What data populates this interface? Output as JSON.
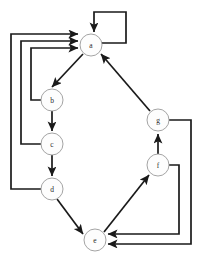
{
  "diagram": {
    "type": "directed-graph",
    "canvas": {
      "width": 199,
      "height": 264,
      "background": "#ffffff"
    },
    "style": {
      "edge_color": "#1a1a1a",
      "node_fill": "#fdfdfd",
      "node_stroke": "#9a9a9a",
      "label_color": "#2b2b2b",
      "node_radius": 11,
      "edge_width": 1.7
    },
    "nodes": [
      {
        "id": "a",
        "label": "a",
        "x": 91,
        "y": 45
      },
      {
        "id": "b",
        "label": "b",
        "x": 52,
        "y": 100
      },
      {
        "id": "c",
        "label": "c",
        "x": 52,
        "y": 144
      },
      {
        "id": "d",
        "label": "d",
        "x": 52,
        "y": 189
      },
      {
        "id": "e",
        "label": "e",
        "x": 95,
        "y": 240
      },
      {
        "id": "f",
        "label": "f",
        "x": 158,
        "y": 165
      },
      {
        "id": "g",
        "label": "g",
        "x": 158,
        "y": 120
      }
    ],
    "edges": [
      {
        "id": "a-a",
        "from": "a",
        "to": "a",
        "kind": "self-loop"
      },
      {
        "id": "a-b",
        "from": "a",
        "to": "b",
        "kind": "straight"
      },
      {
        "id": "b-c",
        "from": "b",
        "to": "c",
        "kind": "straight"
      },
      {
        "id": "c-d",
        "from": "c",
        "to": "d",
        "kind": "straight"
      },
      {
        "id": "d-e",
        "from": "d",
        "to": "e",
        "kind": "straight"
      },
      {
        "id": "e-f",
        "from": "e",
        "to": "f",
        "kind": "straight"
      },
      {
        "id": "f-g",
        "from": "f",
        "to": "g",
        "kind": "straight"
      },
      {
        "id": "g-a",
        "from": "g",
        "to": "a",
        "kind": "straight"
      },
      {
        "id": "b-a",
        "from": "b",
        "to": "a",
        "kind": "orthogonal-left"
      },
      {
        "id": "c-a",
        "from": "c",
        "to": "a",
        "kind": "orthogonal-left"
      },
      {
        "id": "d-a",
        "from": "d",
        "to": "a",
        "kind": "orthogonal-left"
      },
      {
        "id": "f-e",
        "from": "f",
        "to": "e",
        "kind": "orthogonal-right"
      },
      {
        "id": "g-e",
        "from": "g",
        "to": "e",
        "kind": "orthogonal-right"
      }
    ]
  }
}
